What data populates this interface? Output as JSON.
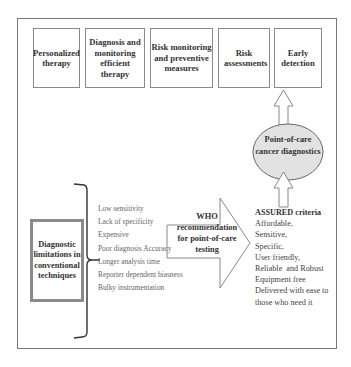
{
  "outcomes": [
    {
      "label": "Personalized therapy"
    },
    {
      "label": "Diagnosis and monitoring efficient therapy"
    },
    {
      "label": "Risk monitoring and preventive measures"
    },
    {
      "label": "Risk assessments"
    },
    {
      "label": "Early detection"
    }
  ],
  "poc": {
    "label": "Point-of-care cancer diagnostics",
    "fill": "#e2e2e2"
  },
  "limitations": {
    "title": "Diagnostic limitations in conventional techniques",
    "items": [
      "Low sensitivity",
      "Lack of specificity",
      "Expensive",
      "Poor diagnosis Accuracy",
      "Longer analysis time",
      "Reporter dependent biasness",
      "Bulky instrumentation"
    ]
  },
  "who": {
    "label": "WHO recommendation for point-of-care testing"
  },
  "assured": {
    "title": "ASSURED criteria",
    "items": [
      "Affordable,",
      "Sensitive,",
      "Specific,",
      "User friendly,",
      "Reliable  and Robust",
      "Equipment free",
      "Delivered with ease to",
      "those who need it"
    ]
  }
}
